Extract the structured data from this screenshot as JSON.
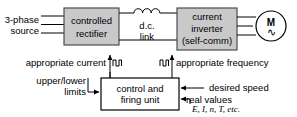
{
  "diagram": {
    "colors": {
      "block_fill": "#c9c9c9",
      "block_stroke": "#4d4d4d",
      "white_fill": "#ffffff",
      "line": "#000000",
      "text": "#000000",
      "background": "#ffffff"
    },
    "blocks": {
      "rectifier": {
        "line1": "controlled",
        "line2": "rectifier"
      },
      "inverter": {
        "line1": "current",
        "line2": "inverter",
        "line3": "(self-comm)"
      },
      "control_unit": {
        "line1": "control and",
        "line2": "firing unit"
      },
      "motor": {
        "symbol": "M",
        "ac_symbol": "∿"
      }
    },
    "labels": {
      "source_line1": "3-phase",
      "source_line2": "source",
      "dc_link_line1": "d.c.",
      "dc_link_line2": "link",
      "appropriate_current": "appropriate current",
      "appropriate_frequency": "appropriate frequency",
      "upper_lower_line1": "upper/lower",
      "upper_lower_line2": "limits",
      "desired_speed": "desired speed",
      "real_values": "real values",
      "real_values_vars": "E, I, n, T, etc."
    },
    "icons": {
      "inductor": "inductor-coil-icon",
      "pulse_left": "pulse-train-icon",
      "pulse_right": "pulse-train-icon",
      "motor": "ac-motor-icon"
    }
  }
}
